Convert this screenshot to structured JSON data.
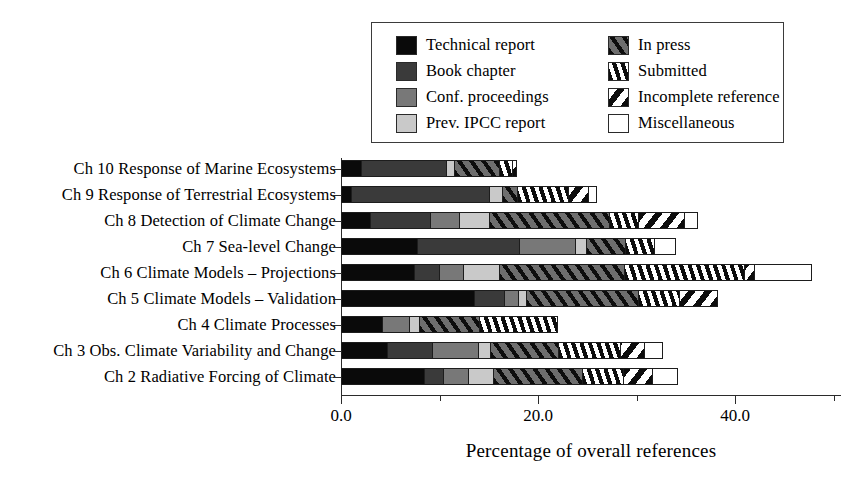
{
  "chart_data": {
    "type": "bar",
    "orientation": "horizontal",
    "stacked": true,
    "title": "",
    "xlabel": "Percentage of overall references",
    "ylabel": "",
    "xlim": [
      0.0,
      50.0
    ],
    "xticks": [
      0.0,
      20.0,
      40.0
    ],
    "xtick_labels": [
      "0.0",
      "20.0",
      "40.0"
    ],
    "xticks_minor": [
      10.0,
      30.0,
      50.0
    ],
    "grid": false,
    "legend_position": "top-right",
    "categories": [
      "Ch 10 Response of Marine Ecosystems",
      "Ch 9 Response of Terrestrial Ecosystems",
      "Ch 8 Detection of Climate Change",
      "Ch 7 Sea-level Change",
      "Ch 6 Climate Models – Projections",
      "Ch 5 Climate Models – Validation",
      "Ch 4 Climate Processes",
      "Ch 3 Obs. Climate Variability and Change",
      "Ch 2 Radiative Forcing of Climate"
    ],
    "series": [
      {
        "name": "Technical report",
        "key": "technical",
        "fill": "solid-black",
        "color": "#0a0a0a",
        "values": [
          2.1,
          1.1,
          3.0,
          7.8,
          7.5,
          13.6,
          4.3,
          4.8,
          8.5
        ]
      },
      {
        "name": "Book chapter",
        "key": "book",
        "fill": "solid-dark-gray",
        "color": "#3a3a3a",
        "values": [
          8.7,
          14.0,
          6.1,
          10.4,
          2.5,
          3.0,
          0.0,
          4.5,
          2.0
        ]
      },
      {
        "name": "Conf. proceedings",
        "key": "conf",
        "fill": "solid-mid-gray",
        "color": "#787878",
        "values": [
          0.0,
          0.0,
          3.0,
          5.7,
          2.5,
          1.5,
          2.7,
          4.7,
          2.5
        ]
      },
      {
        "name": "Prev. IPCC report",
        "key": "ipcc",
        "fill": "solid-light-gray",
        "color": "#c9c9c9",
        "values": [
          0.8,
          1.3,
          3.0,
          1.1,
          3.6,
          0.8,
          1.0,
          1.2,
          2.5
        ]
      },
      {
        "name": "In press",
        "key": "inpress",
        "fill": "diagonal-hatch-on-gray",
        "color": "#6e6e6e",
        "values": [
          4.5,
          1.6,
          12.2,
          3.9,
          12.7,
          11.4,
          6.1,
          6.9,
          9.1
        ]
      },
      {
        "name": "Submitted",
        "key": "submitted",
        "fill": "vertical-hatch",
        "color": "#ffffff",
        "values": [
          1.4,
          5.2,
          3.0,
          3.0,
          12.2,
          4.1,
          7.9,
          6.3,
          4.1
        ]
      },
      {
        "name": "Incomplete reference",
        "key": "incomplete",
        "fill": "back-diagonal-hatch",
        "color": "#ffffff",
        "values": [
          0.4,
          2.0,
          4.6,
          0.0,
          1.0,
          3.9,
          0.0,
          2.5,
          3.0
        ]
      },
      {
        "name": "Miscellaneous",
        "key": "misc",
        "fill": "empty-white",
        "color": "#ffffff",
        "values": [
          0.0,
          0.8,
          1.3,
          2.1,
          5.8,
          0.0,
          0.0,
          1.8,
          2.5
        ]
      }
    ],
    "totals": [
      17.9,
      26.0,
      36.2,
      34.0,
      47.8,
      38.3,
      22.0,
      32.7,
      34.2
    ]
  },
  "legend": {
    "items": [
      {
        "label": "Technical report",
        "icon": "swatch-solid-black-icon"
      },
      {
        "label": "In press",
        "icon": "swatch-diagonal-hatch-icon"
      },
      {
        "label": "Book chapter",
        "icon": "swatch-solid-dark-gray-icon"
      },
      {
        "label": "Submitted",
        "icon": "swatch-vertical-hatch-icon"
      },
      {
        "label": "Conf. proceedings",
        "icon": "swatch-solid-mid-gray-icon"
      },
      {
        "label": "Incomplete reference",
        "icon": "swatch-back-diagonal-hatch-icon"
      },
      {
        "label": "Prev. IPCC report",
        "icon": "swatch-solid-light-gray-icon"
      },
      {
        "label": "Miscellaneous",
        "icon": "swatch-empty-white-icon"
      }
    ]
  },
  "colors": {
    "technical": "#0a0a0a",
    "book": "#3a3a3a",
    "conf": "#787878",
    "ipcc": "#c9c9c9",
    "inpress": "#6e6e6e",
    "hatch": "#0d0d0d",
    "background": "#ffffff",
    "axis": "#2b2b2b"
  }
}
